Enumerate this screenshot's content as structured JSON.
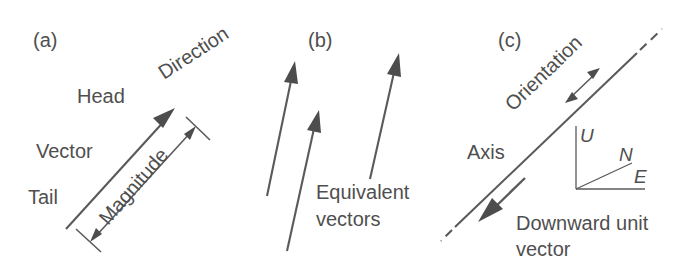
{
  "figure": {
    "line_color": "#5a5a5a",
    "text_color": "#4f4f4f",
    "background": "#ffffff"
  },
  "panels": [
    {
      "id": "a",
      "label": "(a)",
      "labels": {
        "head": "Head",
        "direction": "Direction",
        "vector": "Vector",
        "tail": "Tail",
        "magnitude": "Magnitude"
      }
    },
    {
      "id": "b",
      "label": "(b)",
      "labels": {
        "equivalent_line1": "Equivalent",
        "equivalent_line2": "vectors"
      }
    },
    {
      "id": "c",
      "label": "(c)",
      "labels": {
        "orientation": "Orientation",
        "axis": "Axis",
        "downward_line1": "Downward unit",
        "downward_line2": "vector",
        "up": "U",
        "north": "N",
        "east": "E"
      }
    }
  ]
}
